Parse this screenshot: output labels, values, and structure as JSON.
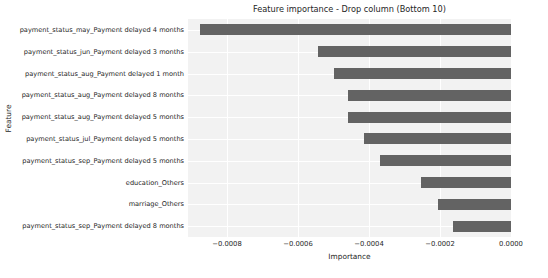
{
  "chart_data": {
    "type": "bar",
    "orientation": "horizontal",
    "title": "Feature importance - Drop column (Bottom 10)",
    "xlabel": "Importance",
    "ylabel": "Feature",
    "categories": [
      "payment_status_may_Payment delayed 4 months",
      "payment_status_jun_Payment delayed 3 months",
      "payment_status_aug_Payment delayed 1 month",
      "payment_status_aug_Payment delayed 8 months",
      "payment_status_aug_Payment delayed 5 months",
      "payment_status_jul_Payment delayed 5 months",
      "payment_status_sep_Payment delayed 5 months",
      "education_Others",
      "marriage_Others",
      "payment_status_sep_Payment delayed 8 months"
    ],
    "values": [
      -0.000875,
      -0.000545,
      -0.0005,
      -0.00046,
      -0.00046,
      -0.000415,
      -0.00037,
      -0.000253,
      -0.000207,
      -0.000162
    ],
    "xlim": [
      -0.00091,
      0.0
    ],
    "ylim": [
      -0.5,
      9.5
    ],
    "xticks": [
      -0.0008,
      -0.0006,
      -0.0004,
      -0.0002,
      0.0
    ],
    "xticklabels": [
      "−0.0008",
      "−0.0006",
      "−0.0004",
      "−0.0002",
      "0.0000"
    ],
    "grid": true,
    "grid_color": "#ffffff",
    "legend": null,
    "bar_color": "#636363",
    "plot_background": "#f2f2f2",
    "figure_background": "#ffffff"
  }
}
